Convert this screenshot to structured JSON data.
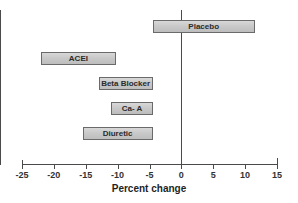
{
  "chart_data": {
    "type": "bar",
    "orientation": "horizontal",
    "title": "",
    "xlabel": "Percent change",
    "ylabel": "",
    "xlim": [
      -25,
      15
    ],
    "xticks": [
      -25,
      -20,
      -15,
      -10,
      -5,
      0,
      5,
      10,
      15
    ],
    "xticklabels": [
      "-25",
      "-20",
      "-15",
      "-10",
      "-5",
      "0",
      "5",
      "10",
      "15"
    ],
    "grid": false,
    "legend": "none",
    "zero_reference_line": 0,
    "categories": [
      "Placebo",
      "ACEI",
      "Beta Blocker",
      "Ca- A",
      "Diuretic"
    ],
    "bars": [
      {
        "label": "Placebo",
        "start": -4.5,
        "end": 11.5
      },
      {
        "label": "ACEI",
        "start": -22.0,
        "end": -10.3
      },
      {
        "label": "Beta Blocker",
        "start": -13.0,
        "end": -4.5
      },
      {
        "label": "Ca- A",
        "start": -11.0,
        "end": -4.5
      },
      {
        "label": "Diuretic",
        "start": -15.5,
        "end": -4.5
      }
    ]
  },
  "colors": {
    "bar_fill": "#c9c9c9",
    "bar_border": "#6a6a6a",
    "axis": "#4a4a4a",
    "text": "#1f1f1f",
    "background": "#ffffff"
  }
}
